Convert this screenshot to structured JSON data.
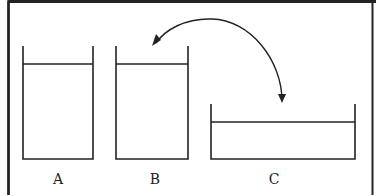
{
  "diagram": {
    "containers": [
      {
        "id": "A",
        "label": "A",
        "shape": "tall-narrow"
      },
      {
        "id": "B",
        "label": "B",
        "shape": "tall-narrow"
      },
      {
        "id": "C",
        "label": "C",
        "shape": "wide-shallow"
      }
    ],
    "arrow": {
      "from": "C",
      "to": "B",
      "style": "curved"
    },
    "colors": {
      "stroke": "#222222",
      "background": "#ffffff"
    }
  }
}
